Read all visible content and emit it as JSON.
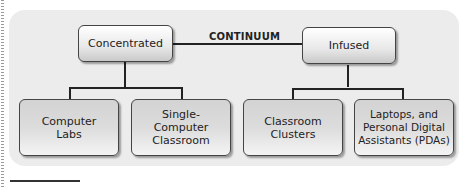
{
  "diagram": {
    "connector_label": "CONTINUUM",
    "top_nodes": {
      "left": "Concentrated",
      "right": "Infused"
    },
    "bottom_nodes": [
      {
        "label": "Computer Labs",
        "parent": "Concentrated"
      },
      {
        "label": "Single-Computer Classroom",
        "parent": "Concentrated"
      },
      {
        "label": "Classroom Clusters",
        "parent": "Infused"
      },
      {
        "label": "Laptops, and Personal Digital Assistants (PDAs)",
        "parent": "Infused"
      }
    ],
    "colors": {
      "panel_background": "#ececec",
      "box_border": "#444444",
      "line": "#222222",
      "text": "#222222"
    }
  }
}
